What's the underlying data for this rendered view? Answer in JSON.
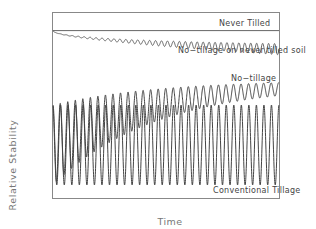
{
  "chart_data": {
    "type": "line",
    "title": "",
    "xlabel": "Time",
    "ylabel": "Relative Stability",
    "grid": false,
    "legend": "inline labels",
    "x_ticks": [],
    "y_ticks": [],
    "xlim": [
      0,
      1
    ],
    "ylim": [
      0,
      1
    ],
    "series": [
      {
        "name": "Never Tilled",
        "shape": "flat line",
        "level": 0.9,
        "amplitude": 0.0,
        "color": "#555555"
      },
      {
        "name": "No-tillage on never tilled soil",
        "shape": "slowly declining line with small oscillation growing over time",
        "start_level": 0.9,
        "end_level": 0.8,
        "amplitude_start": 0.0,
        "amplitude_end": 0.03,
        "color": "#555555"
      },
      {
        "name": "No-tillage",
        "shape": "oscillation with rising trough (recovery)",
        "peak_start": 0.5,
        "peak_end": 0.62,
        "trough_start": 0.07,
        "trough_end": 0.55,
        "cycles": 30,
        "color": "#444444"
      },
      {
        "name": "Conventional Tillage",
        "shape": "constant large oscillation",
        "peak": 0.5,
        "trough": 0.07,
        "cycles": 30,
        "color": "#444444"
      }
    ],
    "annotations": [
      {
        "text": "Never Tilled",
        "position": "top right, above line"
      },
      {
        "text": "No−tillage on never tilled soil",
        "position": "right, below oscillating line"
      },
      {
        "text": "No−tillage",
        "position": "right, above no-tillage wave"
      },
      {
        "text": "Conventional Tillage",
        "position": "bottom right, inside frame"
      }
    ]
  },
  "labels": {
    "never_tilled": "Never Tilled",
    "no_till_never": "No−tillage on never tilled soil",
    "no_till": "No−tillage",
    "conventional": "Conventional Tillage",
    "x_axis": "Time",
    "y_axis": "Relative Stability"
  }
}
